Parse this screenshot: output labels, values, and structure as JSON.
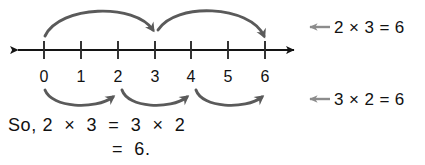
{
  "figure": {
    "title_text": "",
    "colors": {
      "axis": "#141414",
      "tick": "#2b2b2b",
      "arc": "#5a5a5a",
      "pointer_arrow": "#8c8c8c",
      "text": "#111111",
      "background": "#ffffff"
    }
  },
  "number_line": {
    "name": "number-line",
    "min": 0,
    "max": 6,
    "tick_labels": [
      "0",
      "1",
      "2",
      "3",
      "4",
      "5",
      "6"
    ],
    "left_arrow": "left-arrowhead",
    "right_arrow": "right-arrowhead"
  },
  "jumps": {
    "above": {
      "description_label": "2 × 3 = 6",
      "count": 2,
      "step_size": 3,
      "hops": [
        {
          "from": 0,
          "to": 3
        },
        {
          "from": 3,
          "to": 6
        }
      ]
    },
    "below": {
      "description_label": "3 × 2 = 6",
      "count": 3,
      "step_size": 2,
      "hops": [
        {
          "from": 0,
          "to": 2
        },
        {
          "from": 2,
          "to": 4
        },
        {
          "from": 4,
          "to": 6
        }
      ]
    }
  },
  "annotations": [
    {
      "name": "annotation-two-times-three",
      "text": "2 × 3 = 6",
      "arrow_icon": "left-arrow-icon"
    },
    {
      "name": "annotation-three-times-two",
      "text": "3 × 2 = 6",
      "arrow_icon": "left-arrow-icon"
    }
  ],
  "conclusion": {
    "line1": "So, 2  ×  3  =  3  ×  2",
    "line2": "=  6."
  }
}
